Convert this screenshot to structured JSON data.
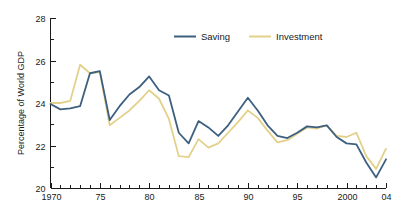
{
  "chart_data": {
    "type": "line",
    "title": "",
    "xlabel": "",
    "ylabel": "Percentage of World GDP",
    "xlim": [
      1970,
      2004
    ],
    "ylim": [
      20,
      28
    ],
    "yticks": [
      20,
      22,
      24,
      26,
      28
    ],
    "ytick_labels": [
      "20",
      "22",
      "24",
      "26",
      "28"
    ],
    "yminor_step": 1,
    "xticks": [
      1970,
      1975,
      1980,
      1985,
      1990,
      1995,
      2000,
      2004
    ],
    "xtick_labels": [
      "1970",
      "75",
      "80",
      "85",
      "90",
      "95",
      "2000",
      "04"
    ],
    "xminor_step": 1,
    "grid": false,
    "legend_position": "top-center",
    "x": [
      1970,
      1971,
      1972,
      1973,
      1974,
      1975,
      1976,
      1977,
      1978,
      1979,
      1980,
      1981,
      1982,
      1983,
      1984,
      1985,
      1986,
      1987,
      1988,
      1989,
      1990,
      1991,
      1992,
      1993,
      1994,
      1995,
      1996,
      1997,
      1998,
      1999,
      2000,
      2001,
      2002,
      2003,
      2004
    ],
    "series": [
      {
        "name": "Saving",
        "color": "#3d5f80",
        "values": [
          23.95,
          23.7,
          23.75,
          23.85,
          25.4,
          25.5,
          23.2,
          23.85,
          24.4,
          24.75,
          25.25,
          24.6,
          24.35,
          22.6,
          22.1,
          23.15,
          22.85,
          22.45,
          22.95,
          23.6,
          24.25,
          23.65,
          22.95,
          22.45,
          22.35,
          22.6,
          22.9,
          22.85,
          22.95,
          22.4,
          22.1,
          22.05,
          21.2,
          20.5,
          21.35
        ]
      },
      {
        "name": "Investment",
        "color": "#e3d08a",
        "values": [
          24.0,
          24.0,
          24.1,
          25.8,
          25.4,
          25.45,
          22.95,
          23.3,
          23.65,
          24.1,
          24.6,
          24.2,
          23.25,
          21.5,
          21.45,
          22.3,
          21.9,
          22.1,
          22.6,
          23.1,
          23.65,
          23.3,
          22.7,
          22.15,
          22.25,
          22.55,
          22.85,
          22.8,
          22.95,
          22.45,
          22.4,
          22.6,
          21.5,
          20.9,
          21.85
        ]
      }
    ]
  },
  "legend": {
    "items": [
      {
        "label": "Saving",
        "color": "#3d5f80"
      },
      {
        "label": "Investment",
        "color": "#e3d08a"
      }
    ]
  },
  "axes": {
    "y_title": "Percentage of World GDP"
  }
}
